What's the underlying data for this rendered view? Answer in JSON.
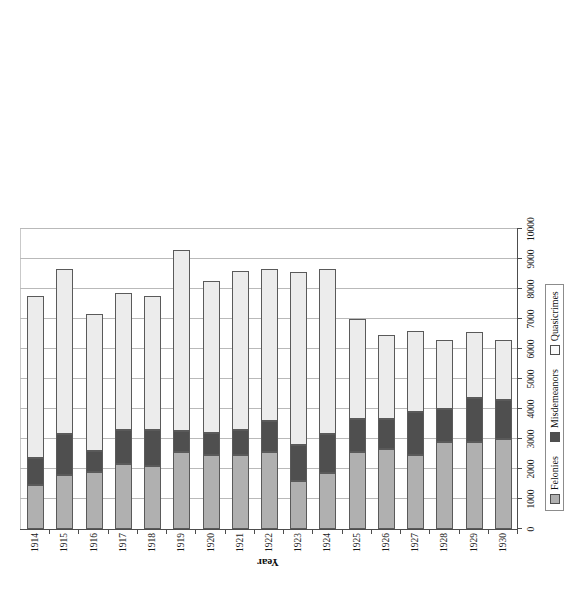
{
  "chart_data": {
    "type": "bar",
    "orientation": "horizontal-stacked",
    "title": "",
    "xlabel": "Cases",
    "ylabel": "Year",
    "xlim": [
      0,
      10000
    ],
    "xticks": [
      0,
      1000,
      2000,
      3000,
      4000,
      5000,
      6000,
      7000,
      8000,
      9000,
      10000
    ],
    "xticklabels": [
      "0",
      "1000",
      "2000",
      "3000",
      "4000",
      "5000",
      "6000",
      "7000",
      "8000",
      "9000",
      "10000"
    ],
    "grid": true,
    "legend_position": "bottom",
    "legend": [
      "Felonies",
      "Misdemeanors",
      "Quasicrimes"
    ],
    "categories": [
      "1914",
      "1915",
      "1916",
      "1917",
      "1918",
      "1919",
      "1920",
      "1921",
      "1922",
      "1923",
      "1924",
      "1925",
      "1926",
      "1927",
      "1928",
      "1929",
      "1930"
    ],
    "series": [
      {
        "name": "Felonies",
        "color": "#b0b0b0",
        "values": [
          1450,
          1800,
          1900,
          2150,
          2100,
          2550,
          2450,
          2450,
          2550,
          1600,
          1850,
          2550,
          2650,
          2450,
          2900,
          2900,
          3000
        ]
      },
      {
        "name": "Misdemeanors",
        "color": "#4f4f4f",
        "values": [
          900,
          1350,
          700,
          1150,
          1200,
          700,
          750,
          850,
          1050,
          1200,
          1300,
          1100,
          1000,
          1450,
          1100,
          1450,
          1300
        ]
      },
      {
        "name": "Quasicrimes",
        "color": "#ececec",
        "values": [
          5400,
          5500,
          4550,
          4550,
          4450,
          6050,
          5050,
          5300,
          5050,
          5750,
          5500,
          3350,
          2800,
          2700,
          2300,
          2200,
          2000
        ]
      }
    ],
    "totals": [
      7750,
      8650,
      7150,
      7850,
      7750,
      9300,
      8250,
      8600,
      8650,
      8550,
      8650,
      7000,
      6450,
      6600,
      6300,
      6550,
      6300
    ]
  },
  "axis": {
    "x_title": "Cases",
    "y_title": "Year"
  },
  "legend": {
    "items": [
      {
        "label": "Felonies",
        "color": "#b0b0b0",
        "swatch": "square-filled-gray"
      },
      {
        "label": "Misdemeanors",
        "color": "#4f4f4f",
        "swatch": "square-filled-dark"
      },
      {
        "label": "Quasicrimes",
        "color": "#fbfbfb",
        "swatch": "square-outline-white"
      }
    ]
  }
}
